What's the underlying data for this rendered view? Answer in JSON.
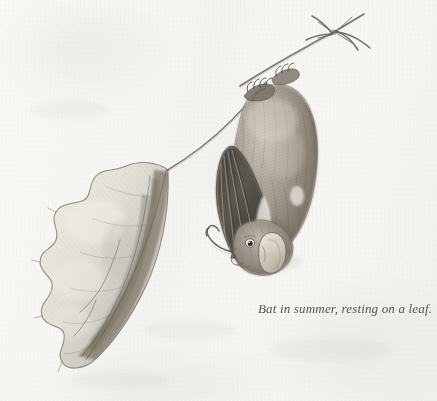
{
  "plate": {
    "title": "Bat in summer, resting on a leaf.",
    "medium": "graphite pencil drawing",
    "caption": "Bat in summer, resting on a leaf.",
    "background_color": "#f6f5f1",
    "ink_color": "#4b4842"
  },
  "subjects": {
    "bat": {
      "label": "bat",
      "pose": "hanging upside down",
      "parts": [
        {
          "label": "body"
        },
        {
          "label": "head"
        },
        {
          "label": "ear"
        },
        {
          "label": "eye"
        },
        {
          "label": "muzzle"
        },
        {
          "label": "folded-wing"
        },
        {
          "label": "wing-finger-bones"
        },
        {
          "label": "thumb-claw"
        },
        {
          "label": "foot-grip"
        }
      ],
      "fur_color": "#8b8378",
      "wing_color": "#55514a"
    },
    "twig": {
      "label": "twig",
      "tip": "forked twig tip",
      "color": "#6f6a61"
    },
    "stem": {
      "label": "leaf stem",
      "color": "#6b6660"
    },
    "leaf": {
      "label": "curled leaf",
      "edge": "lobed wavy margin",
      "body_color": "#d9d7cf",
      "shade_color": "#908a7e"
    }
  },
  "colors": {
    "paper": "#f6f5f1",
    "graphite_light": "#b5b0a6",
    "graphite_mid": "#8b857a",
    "graphite_dark": "#4e4a43",
    "graphite_deep": "#35322c"
  }
}
